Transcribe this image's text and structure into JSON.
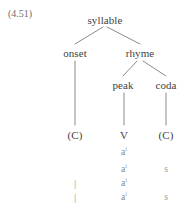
{
  "example": {
    "number": "(4.51)"
  },
  "tree": {
    "type": "syllable-structure-tree",
    "nodes": {
      "root": "syllable",
      "onset": "onset",
      "rhyme": "rhyme",
      "peak": "peak",
      "coda": "coda",
      "onset_slot": "(C)",
      "peak_slot": "V",
      "coda_slot": "(C)"
    },
    "edges": [
      {
        "from": "syllable",
        "to": "onset"
      },
      {
        "from": "syllable",
        "to": "rhyme"
      },
      {
        "from": "rhyme",
        "to": "peak"
      },
      {
        "from": "rhyme",
        "to": "coda"
      },
      {
        "from": "onset",
        "to": "(C)"
      },
      {
        "from": "peak",
        "to": "V"
      },
      {
        "from": "coda",
        "to": "(C)"
      }
    ]
  },
  "segments": {
    "columns": [
      "onset",
      "peak",
      "coda"
    ],
    "rows": [
      {
        "onset": "",
        "peak": "a",
        "peak_sup": "i",
        "coda": ""
      },
      {
        "onset": "",
        "peak": "a",
        "peak_sup": "i",
        "coda": "s"
      },
      {
        "onset": "|",
        "peak": "a",
        "peak_sup": "i",
        "coda": ""
      },
      {
        "onset": "|",
        "peak": "a",
        "peak_sup": "i",
        "coda": "s"
      }
    ]
  },
  "colors": {
    "text": "#3f3f3f",
    "muted": "#8d8d8d",
    "line": "#7d7d7d",
    "background": "#ffffff"
  }
}
